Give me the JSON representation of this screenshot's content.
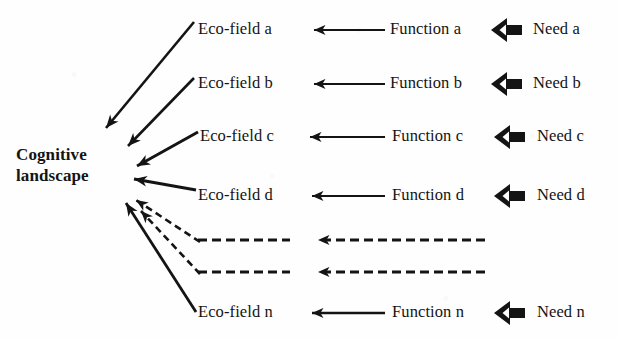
{
  "figure": {
    "background_color": "#fefefe",
    "ink_color": "#141414",
    "hub": {
      "line1": "Cognitive",
      "line2": "landscape"
    },
    "columns": {
      "ecofield_header": "Eco-field",
      "function_header": "Function",
      "need_header": "Need"
    },
    "rows": [
      {
        "id": "a",
        "ecofield": "Eco-field a",
        "function": "Function a",
        "need": "Need a",
        "style": "solid"
      },
      {
        "id": "b",
        "ecofield": "Eco-field b",
        "function": "Function b",
        "need": "Need b",
        "style": "solid"
      },
      {
        "id": "c",
        "ecofield": "Eco-field c",
        "function": "Function c",
        "need": "Need c",
        "style": "solid"
      },
      {
        "id": "d",
        "ecofield": "Eco-field d",
        "function": "Function d",
        "need": "Need d",
        "style": "solid"
      },
      {
        "id": "ellipsis-1",
        "ecofield": "",
        "function": "",
        "need": "",
        "style": "dashed"
      },
      {
        "id": "ellipsis-2",
        "ecofield": "",
        "function": "",
        "need": "",
        "style": "dashed"
      },
      {
        "id": "n",
        "ecofield": "Eco-field n",
        "function": "Function n",
        "need": "Need n",
        "style": "solid"
      }
    ]
  }
}
